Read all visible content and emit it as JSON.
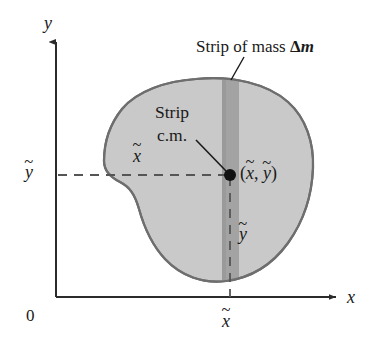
{
  "figure": {
    "type": "diagram",
    "background_color": "#ffffff",
    "width": 372,
    "height": 351
  },
  "axes": {
    "x_label": "x",
    "y_label": "y",
    "origin_label": "0",
    "axis_color": "#2b2b2b",
    "x_axis": {
      "y": 297,
      "x_start": 56,
      "x_end": 340,
      "arrow": "right"
    },
    "y_axis": {
      "x": 56,
      "y_start": 297,
      "y_end": 36,
      "arrow": "up"
    }
  },
  "ticks": {
    "x_tick_label": "x",
    "x_tick_accent": "~",
    "x_tick_position": 230,
    "y_tick_label": "y",
    "y_tick_accent": "~",
    "y_tick_position": 175
  },
  "labels": {
    "strip_of_mass": {
      "text_before": "Strip of mass ",
      "delta": "Δ",
      "mass_var": "m"
    },
    "strip_cm_line1": "Strip",
    "strip_cm_line2": "c.m.",
    "coords": {
      "open": "(",
      "x_var": "x",
      "x_accent": "~",
      "separator": ", ",
      "y_var": "y",
      "y_accent": "~",
      "close": ")"
    },
    "inner_x_label": "x",
    "inner_x_accent": "~",
    "inner_y_label": "y",
    "inner_y_accent": "~"
  },
  "shape": {
    "name": "irregular-lamina",
    "fill_color": "#c9c9c9",
    "outline_color": "#6e6e6e",
    "outline_width": 2.2
  },
  "strip": {
    "name": "mass-strip",
    "fill_color": "#a3a3a3",
    "x_left": 222,
    "x_right": 239,
    "label_ref": "Strip of mass Δm"
  },
  "point": {
    "name": "strip-center-of-mass",
    "x": 230,
    "y": 175,
    "radius": 6,
    "color": "#111111"
  },
  "guides": {
    "dash_color": "#555555",
    "horizontal_dashed": {
      "y": 175,
      "x_start": 58,
      "x_end": 230
    },
    "vertical_dashed": {
      "x": 230,
      "y_start": 175,
      "y_end": 297
    },
    "leader_cm": {
      "x1": 196,
      "y1": 140,
      "x2": 227,
      "y2": 172
    },
    "leader_strip_mass": {
      "x1": 243,
      "y1": 58,
      "x2": 231,
      "y2": 80
    }
  }
}
